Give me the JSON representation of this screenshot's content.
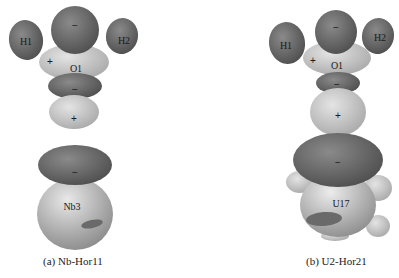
{
  "figure": {
    "panels": [
      {
        "caption": "(a) Nb-Hor11",
        "atoms": {
          "h1": "H1",
          "h2": "H2",
          "o": "O1",
          "metal": "Nb3"
        },
        "signs": {
          "top_lobe": "−",
          "o_left": "+",
          "o_below": "−",
          "lower_lobe": "+",
          "metal_cap": "−"
        }
      },
      {
        "caption": "(b) U2-Hor21",
        "atoms": {
          "h1": "H1",
          "h2": "H2",
          "o": "O1",
          "metal": "U17"
        },
        "signs": {
          "top_lobe": "−",
          "o_left": "+",
          "o_below": "−",
          "lower_lobe": "+",
          "metal_cap": "−"
        }
      }
    ],
    "colors": {
      "negative_lobe": "#6e6e6e",
      "positive_lobe": "#c9c9c9",
      "metal_sphere": "#b8b8b8",
      "background": "#ffffff"
    }
  }
}
